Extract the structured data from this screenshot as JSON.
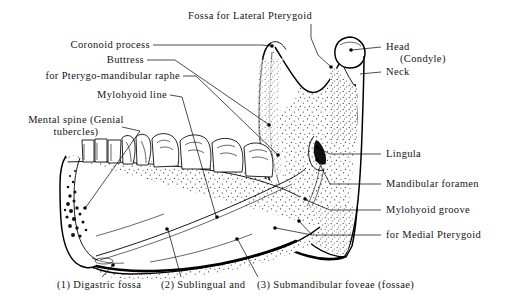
{
  "figure": {
    "background_color": "#ffffff",
    "ink_color": "#000000"
  },
  "labels": {
    "fossa_lateral_pterygoid": "Fossa for Lateral Pterygoid",
    "coronoid_process": "Coronoid process",
    "buttress": "Buttress",
    "pterygomandibular_raphe": "for Pterygo-mandibular raphe",
    "mylohyoid_line": "Mylohyoid line",
    "mental_spine_line1": "Mental spine (Genial",
    "mental_spine_line2": "tubercles)",
    "head_line1": "Head",
    "head_line2": "(Condyle)",
    "neck": "Neck",
    "lingula": "Lingula",
    "mandibular_foramen": "Mandibular foramen",
    "mylohyoid_groove": "Mylohyoid groove",
    "medial_pterygoid": "for Medial Pterygoid"
  },
  "footnotes": {
    "item1": "(1) Digastric fossa",
    "item2": "(2) Sublingual and",
    "item3": "(3) Submandibular foveae (fossae)"
  },
  "callout_index": {
    "one": "(1)",
    "two": "(2)",
    "three": "(3)"
  }
}
